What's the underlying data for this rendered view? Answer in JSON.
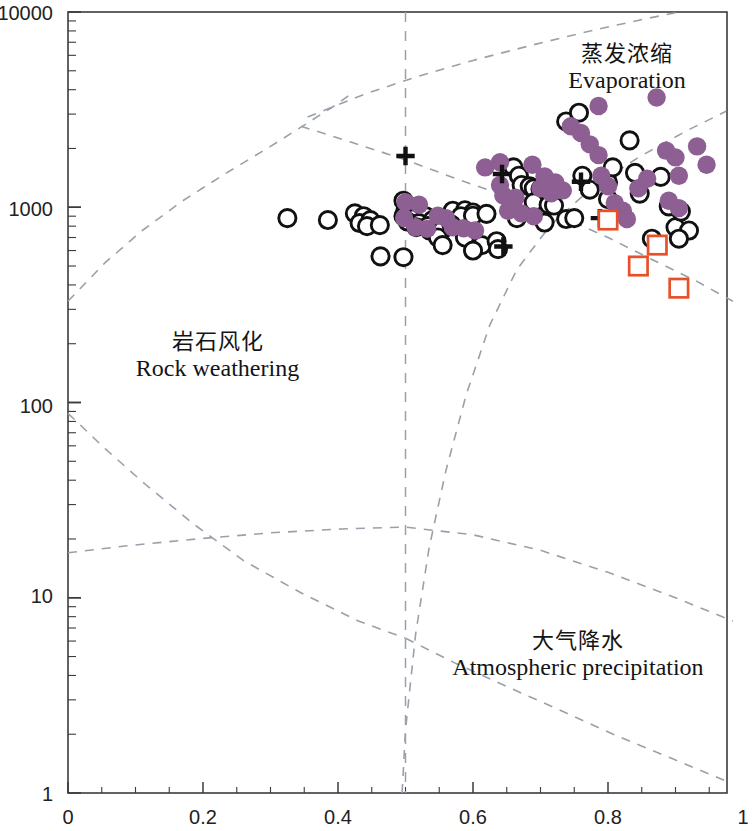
{
  "chart_data": {
    "type": "scatter",
    "title": "",
    "subtitle": "",
    "xlabel": "",
    "ylabel": "",
    "xlim": [
      0,
      1
    ],
    "ylim": [
      1,
      10000
    ],
    "yscale": "log",
    "xscale": "linear",
    "grid": false,
    "legend_position": "none",
    "x_ticks": [
      "0",
      "0.2",
      "0.4",
      "0.6",
      "0.8",
      "1"
    ],
    "x_tick_values": [
      0,
      0.2,
      0.4,
      0.6,
      0.8,
      1
    ],
    "y_ticks": [
      "1",
      "10",
      "100",
      "1000",
      "10000"
    ],
    "y_tick_values": [
      1,
      10,
      100,
      1000,
      10000
    ],
    "annotations": [
      {
        "id": "evaporation",
        "cn": "蒸发浓缩",
        "en": "Evaporation",
        "x": 0.78,
        "y": 3200
      },
      {
        "id": "rock-weathering",
        "cn": "岩石风化",
        "en": "Rock weathering",
        "x": 0.255,
        "y": 155
      },
      {
        "id": "atmospheric-precipitation",
        "cn": "大气降水",
        "en": "Atmospheric precipitation",
        "x": 0.845,
        "y": 4.6
      }
    ],
    "axis_bottom_partial_label": "图例",
    "series": [
      {
        "name": "open-circle",
        "marker": "open-circle",
        "color": "#111111",
        "fill": "none",
        "points": [
          [
            0.325,
            880
          ],
          [
            0.385,
            860
          ],
          [
            0.425,
            930
          ],
          [
            0.438,
            900
          ],
          [
            0.432,
            830
          ],
          [
            0.448,
            860
          ],
          [
            0.443,
            800
          ],
          [
            0.462,
            810
          ],
          [
            0.497,
            1080
          ],
          [
            0.51,
            1000
          ],
          [
            0.5,
            960
          ],
          [
            0.52,
            940
          ],
          [
            0.497,
            900
          ],
          [
            0.513,
            880
          ],
          [
            0.53,
            900
          ],
          [
            0.503,
            845
          ],
          [
            0.52,
            830
          ],
          [
            0.54,
            860
          ],
          [
            0.516,
            790
          ],
          [
            0.533,
            800
          ],
          [
            0.552,
            820
          ],
          [
            0.536,
            760
          ],
          [
            0.555,
            770
          ],
          [
            0.548,
            700
          ],
          [
            0.57,
            960
          ],
          [
            0.588,
            965
          ],
          [
            0.6,
            940
          ],
          [
            0.582,
            900
          ],
          [
            0.6,
            905
          ],
          [
            0.62,
            925
          ],
          [
            0.568,
            815
          ],
          [
            0.588,
            700
          ],
          [
            0.613,
            640
          ],
          [
            0.635,
            670
          ],
          [
            0.637,
            610
          ],
          [
            0.66,
            1600
          ],
          [
            0.668,
            1450
          ],
          [
            0.672,
            1300
          ],
          [
            0.684,
            1280
          ],
          [
            0.69,
            1250
          ],
          [
            0.7,
            1240
          ],
          [
            0.705,
            1150
          ],
          [
            0.69,
            1060
          ],
          [
            0.712,
            1030
          ],
          [
            0.72,
            1020
          ],
          [
            0.738,
            2750
          ],
          [
            0.757,
            3050
          ],
          [
            0.762,
            1450
          ],
          [
            0.8,
            1340
          ],
          [
            0.807,
            1600
          ],
          [
            0.8,
            1100
          ],
          [
            0.832,
            2200
          ],
          [
            0.84,
            1500
          ],
          [
            0.878,
            1430
          ],
          [
            0.89,
            1010
          ],
          [
            0.9,
            790
          ],
          [
            0.92,
            760
          ],
          [
            0.905,
            690
          ],
          [
            0.865,
            690
          ],
          [
            0.908,
            950
          ],
          [
            0.463,
            560
          ],
          [
            0.497,
            555
          ],
          [
            0.6,
            600
          ],
          [
            0.555,
            640
          ],
          [
            0.665,
            880
          ],
          [
            0.706,
            835
          ],
          [
            0.738,
            870
          ],
          [
            0.75,
            880
          ],
          [
            0.773,
            1230
          ],
          [
            0.847,
            1175
          ]
        ]
      },
      {
        "name": "filled-purple-circle",
        "marker": "filled-circle",
        "color": "#8d5f92",
        "fill": "#8d5f92",
        "points": [
          [
            0.5,
            1060
          ],
          [
            0.52,
            1030
          ],
          [
            0.498,
            880
          ],
          [
            0.515,
            790
          ],
          [
            0.532,
            775
          ],
          [
            0.548,
            905
          ],
          [
            0.56,
            880
          ],
          [
            0.57,
            790
          ],
          [
            0.586,
            780
          ],
          [
            0.603,
            760
          ],
          [
            0.618,
            1600
          ],
          [
            0.64,
            1300
          ],
          [
            0.645,
            1150
          ],
          [
            0.663,
            1120
          ],
          [
            0.652,
            960
          ],
          [
            0.672,
            930
          ],
          [
            0.69,
            900
          ],
          [
            0.7,
            1250
          ],
          [
            0.716,
            1180
          ],
          [
            0.733,
            1220
          ],
          [
            0.745,
            2600
          ],
          [
            0.76,
            2400
          ],
          [
            0.773,
            2100
          ],
          [
            0.786,
            1850
          ],
          [
            0.79,
            1450
          ],
          [
            0.8,
            1280
          ],
          [
            0.81,
            1050
          ],
          [
            0.822,
            960
          ],
          [
            0.828,
            870
          ],
          [
            0.845,
            1250
          ],
          [
            0.858,
            1400
          ],
          [
            0.872,
            3650
          ],
          [
            0.886,
            1950
          ],
          [
            0.9,
            1800
          ],
          [
            0.905,
            1450
          ],
          [
            0.89,
            1080
          ],
          [
            0.905,
            990
          ],
          [
            0.786,
            3300
          ],
          [
            0.932,
            2050
          ],
          [
            0.946,
            1650
          ],
          [
            0.64,
            1700
          ],
          [
            0.688,
            1650
          ],
          [
            0.706,
            1440
          ],
          [
            0.722,
            1340
          ]
        ]
      },
      {
        "name": "black-plus",
        "marker": "plus",
        "color": "#111111",
        "fill": "none",
        "points": [
          [
            0.5,
            1830
          ],
          [
            0.643,
            1480
          ],
          [
            0.76,
            1350
          ],
          [
            0.788,
            880
          ],
          [
            0.645,
            630
          ]
        ]
      },
      {
        "name": "red-open-square",
        "marker": "open-square",
        "color": "#e8502a",
        "fill": "none",
        "points": [
          [
            0.8,
            860
          ],
          [
            0.873,
            640
          ],
          [
            0.845,
            500
          ],
          [
            0.905,
            385
          ]
        ]
      }
    ],
    "boundary_label": "Gibbs boundary envelopes (dashed)",
    "boundary_color": "#9aa0ab"
  },
  "axes": {
    "y_label_10000": "10000",
    "y_label_1000": "1000",
    "y_label_100": "100",
    "y_label_10": "10",
    "y_label_1": "1",
    "x_label_0": "0",
    "x_label_02": "0.2",
    "x_label_04": "0.4",
    "x_label_06": "0.6",
    "x_label_08": "0.8",
    "x_label_1": "1"
  },
  "regions": {
    "evaporation": {
      "cn": "蒸发浓缩",
      "en": "Evaporation"
    },
    "rock_weathering": {
      "cn": "岩石风化",
      "en": "Rock weathering"
    },
    "atmospheric_precipitation": {
      "cn": "大气降水",
      "en": "Atmospheric precipitation"
    }
  },
  "bottom_axis_title": "图例"
}
